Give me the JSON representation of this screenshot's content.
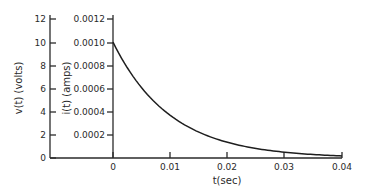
{
  "chart_data": {
    "type": "line",
    "title": "",
    "xlabel": "t(sec)",
    "ylabel": "v(t) (volts)",
    "ylabel_secondary": "i(t) (amps)",
    "xlim": [
      0,
      0.04
    ],
    "ylim": [
      0,
      12
    ],
    "ylim_secondary": [
      0,
      0.0012
    ],
    "grid": false,
    "legend": null,
    "x_ticks": [
      "0",
      "0.01",
      "0.02",
      "0.03",
      "0.04"
    ],
    "y_ticks": [
      "0",
      "2",
      "4",
      "6",
      "8",
      "10",
      "12"
    ],
    "y_ticks_secondary": [
      "0.0002",
      "0.0004",
      "0.0006",
      "0.0008",
      "0.0010",
      "0.0012"
    ],
    "series": [
      {
        "name": "v(t) / i(t) exponential decay",
        "x": [
          0,
          0.005,
          0.01,
          0.015,
          0.02,
          0.025,
          0.03,
          0.035,
          0.04
        ],
        "values": [
          10,
          6.07,
          3.68,
          2.23,
          1.35,
          0.82,
          0.5,
          0.3,
          0.18
        ],
        "values_secondary": [
          0.001,
          0.000607,
          0.000368,
          0.000223,
          0.000135,
          8.2e-05,
          5e-05,
          3e-05,
          1.8e-05
        ]
      }
    ],
    "annotations": []
  },
  "labels": {
    "v_axis_title": "v(t) (volts)",
    "i_axis_title": "i(t) (amps)",
    "t_axis_title": "t(sec)",
    "v_ticks": [
      "0",
      "2",
      "4",
      "6",
      "8",
      "10",
      "12"
    ],
    "i_ticks": [
      "0.0002",
      "0.0004",
      "0.0006",
      "0.0008",
      "0.0010",
      "0.0012"
    ],
    "t_ticks": [
      "0",
      "0.01",
      "0.02",
      "0.03",
      "0.04"
    ]
  }
}
